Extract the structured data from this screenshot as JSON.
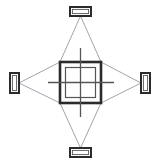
{
  "canvas": {
    "width": 160,
    "height": 166,
    "background": "#ffffff"
  },
  "colors": {
    "stroke_dark": "#2b2b2b",
    "stroke_mid": "#555555",
    "stroke_light": "#8a8a99",
    "fill_white": "#ffffff"
  },
  "diagram": {
    "type": "alignment-sight-diagram",
    "center": {
      "x": 80.5,
      "y": 82.5
    }
  },
  "target": {
    "name": "central-square-target",
    "outer": {
      "x": 60,
      "y": 62,
      "width": 41,
      "height": 41,
      "stroke_width": 2.6
    },
    "inner": {
      "x": 65.5,
      "y": 67.5,
      "width": 30,
      "height": 30,
      "stroke_width": 1.2
    }
  },
  "crosshair": {
    "name": "crosshair-alignment-lines",
    "horizontal": {
      "x1": 48,
      "y1": 82.5,
      "x2": 114,
      "y2": 82.5
    },
    "vertical": {
      "x1": 80.5,
      "y1": 48,
      "x2": 80.5,
      "y2": 117
    },
    "stroke_width": 1.3
  },
  "markers": [
    {
      "id": "marker-top",
      "orientation": "horizontal",
      "x": 70,
      "y": 7,
      "width": 21,
      "height": 9,
      "anchor": {
        "x": 80.5,
        "y": 16
      }
    },
    {
      "id": "marker-bottom",
      "orientation": "horizontal",
      "x": 70,
      "y": 148,
      "width": 21,
      "height": 9,
      "anchor": {
        "x": 80.5,
        "y": 148
      }
    },
    {
      "id": "marker-left",
      "orientation": "vertical",
      "x": 10,
      "y": 73,
      "width": 9,
      "height": 20,
      "anchor": {
        "x": 19,
        "y": 83
      }
    },
    {
      "id": "marker-right",
      "orientation": "vertical",
      "x": 141,
      "y": 73,
      "width": 9,
      "height": 20,
      "anchor": {
        "x": 141,
        "y": 83
      }
    }
  ],
  "sight_lines": [
    {
      "id": "sight-top-left",
      "x1": 80.5,
      "y1": 16,
      "x2": 60,
      "y2": 62
    },
    {
      "id": "sight-top-right",
      "x1": 80.5,
      "y1": 16,
      "x2": 101,
      "y2": 62
    },
    {
      "id": "sight-bottom-left",
      "x1": 80.5,
      "y1": 148,
      "x2": 60,
      "y2": 103
    },
    {
      "id": "sight-bottom-right",
      "x1": 80.5,
      "y1": 148,
      "x2": 101,
      "y2": 103
    },
    {
      "id": "sight-left-top",
      "x1": 19,
      "y1": 83,
      "x2": 60,
      "y2": 62
    },
    {
      "id": "sight-left-bottom",
      "x1": 19,
      "y1": 83,
      "x2": 60,
      "y2": 103
    },
    {
      "id": "sight-right-top",
      "x1": 141,
      "y1": 83,
      "x2": 101,
      "y2": 62
    },
    {
      "id": "sight-right-bottom",
      "x1": 141,
      "y1": 83,
      "x2": 101,
      "y2": 103
    }
  ]
}
